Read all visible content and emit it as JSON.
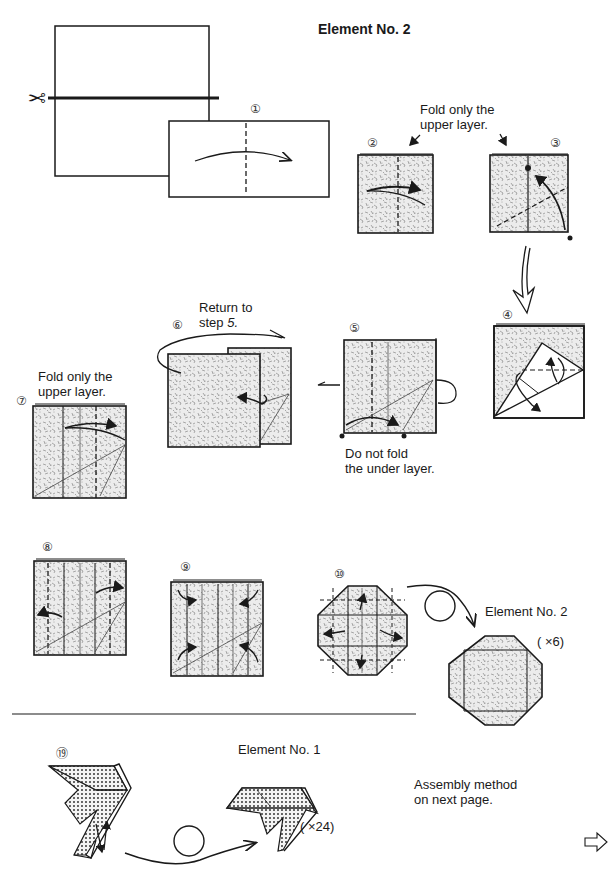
{
  "page": {
    "title": "Element No. 2",
    "colors": {
      "ink": "#1a1a1a",
      "paper": "#ffffff",
      "texture": "#e9e9e9",
      "dots": "#2a2a2a"
    }
  },
  "steps": [
    {
      "number": "①",
      "label": ""
    },
    {
      "number": "②",
      "label": ""
    },
    {
      "number": "③",
      "label": ""
    },
    {
      "number": "④",
      "label": ""
    },
    {
      "number": "⑤",
      "label": ""
    },
    {
      "number": "⑥",
      "label": ""
    },
    {
      "number": "⑦",
      "label": ""
    },
    {
      "number": "⑧",
      "label": ""
    },
    {
      "number": "⑨",
      "label": ""
    },
    {
      "number": "⑩",
      "label": ""
    },
    {
      "number": "⑲",
      "label": ""
    }
  ],
  "annotations": {
    "fold_upper_1": [
      "Fold only the",
      "upper layer."
    ],
    "return_to": [
      "Return to",
      "step "
    ],
    "return_step": "5.",
    "do_not_fold": [
      "Do not fold",
      "the under layer."
    ],
    "fold_upper_2": [
      "Fold only the",
      "upper layer."
    ],
    "element2_result": "Element No. 2",
    "element2_count": "( ×6)",
    "element1_title": "Element No. 1",
    "element1_count": "( ×24)",
    "assembly": [
      "Assembly method",
      "on next page."
    ]
  },
  "icons": {
    "scissors": "✂",
    "next_page_arrow": "⇨"
  }
}
